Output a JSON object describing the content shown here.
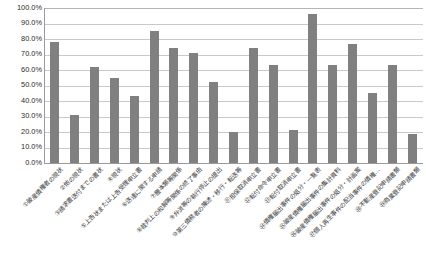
{
  "chart_data": {
    "type": "bar",
    "title": "",
    "xlabel": "",
    "ylabel": "",
    "ylim": [
      0,
      100
    ],
    "grid": true,
    "legend": false,
    "bar_color": "#808080",
    "axis_color": "#9a9a9a",
    "gridline_color": "#c9c9c9",
    "ytick_labels": [
      "100.0%",
      "90.0%",
      "80.0%",
      "70.0%",
      "60.0%",
      "50.0%",
      "40.0%",
      "30.0%",
      "20.0%",
      "10.0%",
      "0.0%"
    ],
    "ytick_values": [
      100,
      90,
      80,
      70,
      60,
      50,
      40,
      30,
      20,
      10,
      0
    ],
    "categories": [
      "①破産債権者の現状",
      "②他の現状",
      "③請求書送付までの書状",
      "④現状",
      "⑤上告状または上告受理申立書",
      "⑥送達に関する申請",
      "⑦謄本類等関係",
      "⑧裁判上の和解等関係の終了事由",
      "⑨弁済等の執行停止の提出",
      "⑩第三債務者の陳述・移行・転送等",
      "⑪担保取消申立書",
      "⑫転付命令申立書",
      "⑬転付取消申立書",
      "⑭債権届出事件の処分・一覧表",
      "⑮破産債権届出事件の集計資料",
      "⑯破産債権届出事件の処分・計画案",
      "⑰個人再生事件の配当事件の債権…",
      "⑱不動産登記申請書類",
      "⑲商業登記申請書類"
    ],
    "values": [
      78,
      31,
      62,
      55,
      43,
      85,
      74,
      71,
      52,
      20,
      74,
      63,
      21,
      96,
      63,
      77,
      45,
      63,
      19
    ]
  }
}
